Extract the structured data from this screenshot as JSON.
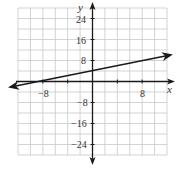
{
  "chart_data": {
    "type": "line",
    "title": "",
    "xlabel": "x",
    "ylabel": "y",
    "xlim": [
      -12,
      12
    ],
    "ylim": [
      -28,
      28
    ],
    "grid": true,
    "x_grid_step": 2,
    "y_grid_step": 4,
    "x_ticks": [
      -8,
      8
    ],
    "y_ticks": [
      24,
      16,
      8,
      -8,
      -16,
      -24
    ],
    "series": [
      {
        "name": "y = 0.5x + 4",
        "equation": "y = 0.5x + 4",
        "slope": 0.5,
        "intercept": 4,
        "x": [
          -12,
          12
        ],
        "y": [
          -2,
          10
        ],
        "arrows_both_ends": true
      }
    ]
  },
  "labels": {
    "x_axis": "x",
    "y_axis": "y",
    "x_tick_neg": "−8",
    "x_tick_pos": "8",
    "y_tick_24": "24",
    "y_tick_16": "16",
    "y_tick_8": "8",
    "y_tick_n8": "−8",
    "y_tick_n16": "−16",
    "y_tick_n24": "−24"
  },
  "colors": {
    "grid": "#c8c8c8",
    "axis": "#1a1a1a",
    "line": "#1a1a1a"
  }
}
